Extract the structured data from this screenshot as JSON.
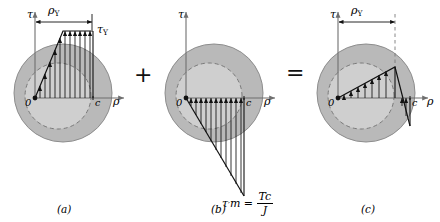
{
  "figure": {
    "operators": {
      "plus": "+",
      "equals": "="
    },
    "axis_labels": {
      "tau": "τ",
      "rho": "ρ",
      "origin": "0",
      "radius": "c"
    },
    "dimension_label": {
      "base": "ρ",
      "sub": "Y"
    },
    "colors": {
      "shaft_outer": "#b9b9b9",
      "shaft_inner": "#cfcfcf",
      "outline": "#8d8d8d",
      "dashed": "#7a7a7a",
      "stress_line": "#111111",
      "axis": "#6f6f6f"
    }
  },
  "panels": [
    {
      "id": "a",
      "caption": "(a)",
      "description": "Elastoplastic loading stress distribution",
      "peak_label": {
        "base": "τ",
        "sub": "Y"
      },
      "dimension": {
        "base": "ρ",
        "sub": "Y"
      },
      "axis_tau": "τ",
      "axis_rho": "ρ",
      "origin": "0",
      "radius_label": "c",
      "geometry": {
        "type": "elastoplastic",
        "rho_Y_fraction": 0.52,
        "plateau_value": 1.0,
        "hatch_count": 11,
        "sign": "positive"
      }
    },
    {
      "id": "b",
      "caption": "(b)",
      "description": "Elastic unloading (reverse) stress distribution",
      "peak_formula": {
        "symbol": "τ",
        "prime": "′",
        "sub": "m",
        "equals": "=",
        "numerator": "Tc",
        "denominator": "J"
      },
      "axis_tau": "τ",
      "axis_rho": "ρ",
      "origin": "0",
      "radius_label": "c",
      "geometry": {
        "type": "linear-negative",
        "peak_value": -1.62,
        "hatch_count": 11,
        "sign": "negative"
      }
    },
    {
      "id": "c",
      "caption": "(c)",
      "description": "Residual stress distribution after unloading",
      "dimension": {
        "base": "ρ",
        "sub": "Y"
      },
      "axis_tau": "τ",
      "axis_rho": "ρ",
      "origin": "0",
      "radius_label": "c",
      "geometry": {
        "type": "residual",
        "rho_Y_fraction": 0.52,
        "peak_value": 0.48,
        "end_value": -0.58,
        "hatch_count": 7,
        "sign": "mixed"
      }
    }
  ]
}
